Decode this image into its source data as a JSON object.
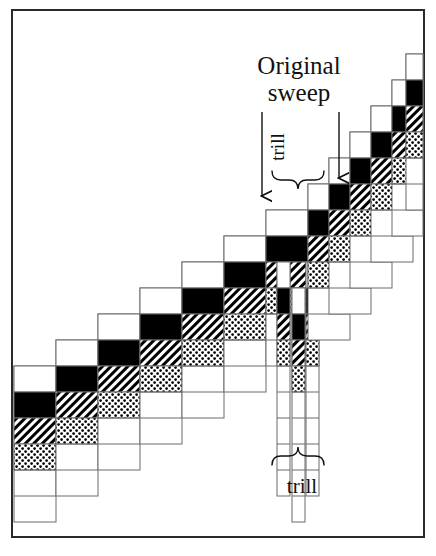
{
  "figure": {
    "kind": "schematic-diagram",
    "title_hidden": "",
    "border_color": "#2a2a2a",
    "background": "#ffffff"
  },
  "labels": {
    "original_sweep": "Original\nsweep",
    "original_sweep_line1": "Original",
    "original_sweep_line2": "sweep",
    "trill_top": "trill",
    "trill_bottom": "trill"
  },
  "palette": {
    "outline": "#6b6b6b",
    "ink": "#111111",
    "black_fill": "#000000",
    "white_fill": "#ffffff",
    "hatch_fill": "#000000",
    "dot_fill": "#000000"
  },
  "geometry": {
    "cell_w": 42,
    "cell_h": 26,
    "narrow_w": 13,
    "origin_x": 14,
    "baseline_y": 470
  },
  "chart_data": {
    "type": "diagram",
    "fills_legend": [
      "white",
      "black",
      "hatch",
      "dots"
    ],
    "column_count": 18,
    "columns": [
      {
        "index": 0,
        "x": 14,
        "w": 42,
        "top": 366,
        "depth": 6,
        "fills": [
          "white",
          "black",
          "hatch",
          "dots"
        ]
      },
      {
        "index": 1,
        "x": 56,
        "w": 42,
        "top": 340,
        "depth": 6,
        "fills": [
          "white",
          "black",
          "hatch",
          "dots"
        ]
      },
      {
        "index": 2,
        "x": 98,
        "w": 42,
        "top": 314,
        "depth": 6,
        "fills": [
          "white",
          "black",
          "hatch",
          "dots"
        ]
      },
      {
        "index": 3,
        "x": 140,
        "w": 42,
        "top": 288,
        "depth": 6,
        "fills": [
          "white",
          "black",
          "hatch",
          "dots"
        ]
      },
      {
        "index": 4,
        "x": 182,
        "w": 42,
        "top": 262,
        "depth": 6,
        "fills": [
          "white",
          "black",
          "hatch",
          "dots"
        ]
      },
      {
        "index": 5,
        "x": 224,
        "w": 42,
        "top": 236,
        "depth": 6,
        "fills": [
          "white",
          "black",
          "hatch",
          "dots"
        ]
      },
      {
        "index": 6,
        "x": 266,
        "w": 42,
        "top": 210,
        "depth": 6,
        "fills": [
          "white",
          "black",
          "hatch",
          "dots"
        ]
      },
      {
        "index": 7,
        "x": 277,
        "w": 13,
        "top": 262,
        "depth": 9,
        "fills": [
          "white",
          "black",
          "hatch",
          "dots"
        ],
        "trill": true
      },
      {
        "index": 8,
        "x": 292,
        "w": 13,
        "top": 288,
        "depth": 9,
        "fills": [
          "white",
          "black",
          "hatch",
          "dots"
        ],
        "trill": true
      },
      {
        "index": 9,
        "x": 306,
        "w": 13,
        "top": 262,
        "depth": 9,
        "fills": [
          "white",
          "black",
          "hatch",
          "dots"
        ],
        "trill": true
      },
      {
        "index": 10,
        "x": 308,
        "w": 42,
        "top": 184,
        "depth": 6,
        "fills": [
          "white",
          "black",
          "hatch",
          "dots"
        ]
      },
      {
        "index": 11,
        "x": 329,
        "w": 42,
        "top": 158,
        "depth": 6,
        "fills": [
          "white",
          "black",
          "hatch",
          "dots"
        ]
      },
      {
        "index": 12,
        "x": 350,
        "w": 42,
        "top": 132,
        "depth": 6,
        "fills": [
          "white",
          "black",
          "hatch",
          "dots"
        ]
      },
      {
        "index": 13,
        "x": 371,
        "w": 42,
        "top": 106,
        "depth": 6,
        "fills": [
          "white",
          "black",
          "hatch",
          "dots"
        ]
      },
      {
        "index": 14,
        "x": 392,
        "w": 42,
        "top": 80,
        "depth": 6,
        "fills": [
          "white",
          "black",
          "hatch",
          "dots"
        ]
      },
      {
        "index": 15,
        "x": 406,
        "w": 42,
        "top": 54,
        "depth": 6,
        "fills": [
          "white",
          "black",
          "hatch",
          "dots"
        ]
      }
    ],
    "annotations": [
      {
        "name": "arrow-original-sweep-left",
        "type": "arrow",
        "x": 262,
        "y1": 112,
        "y2": 196,
        "label": "Original sweep"
      },
      {
        "name": "arrow-original-sweep-right",
        "type": "arrow",
        "x": 339,
        "y1": 112,
        "y2": 178,
        "label": "Original sweep"
      },
      {
        "name": "brace-trill-top",
        "type": "brace",
        "x1": 272,
        "x2": 324,
        "y": 180,
        "direction": "up",
        "label": "trill"
      },
      {
        "name": "brace-trill-bottom",
        "type": "brace",
        "x1": 272,
        "x2": 324,
        "y": 456,
        "direction": "down",
        "label": "trill"
      }
    ]
  }
}
